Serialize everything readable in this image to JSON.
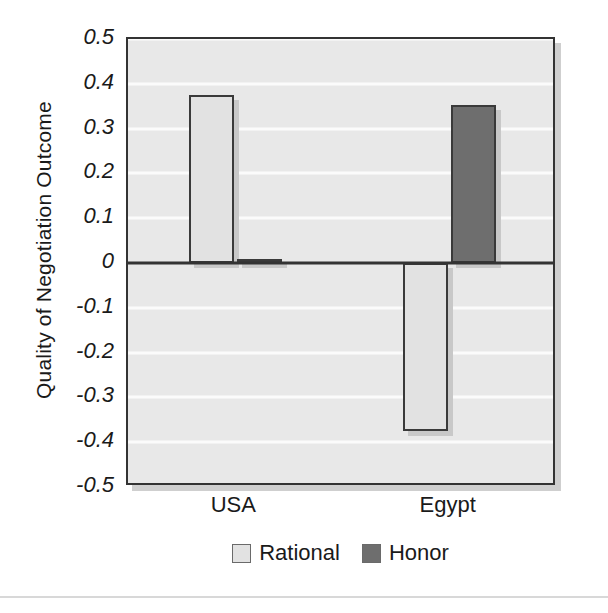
{
  "chart_data": {
    "type": "bar",
    "title": "",
    "subtitle": "",
    "xlabel": "",
    "ylabel": "Quality of Negotiation Outcome",
    "categories": [
      "USA",
      "Egypt"
    ],
    "series": [
      {
        "name": "Rational",
        "color": "#e2e2e2",
        "values": [
          0.375,
          -0.375
        ]
      },
      {
        "name": "Honor",
        "color": "#6e6e6e",
        "values": [
          0.008,
          0.353
        ]
      }
    ],
    "ylim": [
      -0.5,
      0.5
    ],
    "ytick_labels": [
      "0.5",
      "0.4",
      "0.3",
      "0.2",
      "0.1",
      "0",
      "-0.1",
      "-0.2",
      "-0.3",
      "-0.4",
      "-0.5"
    ],
    "ytick_values": [
      0.5,
      0.4,
      0.3,
      0.2,
      0.1,
      0,
      -0.1,
      -0.2,
      -0.3,
      -0.4,
      -0.5
    ],
    "grid": true,
    "grid_color": "#fbfbfb",
    "zero_line": true,
    "legend_position": "bottom",
    "plot_background": "#e8e8e8",
    "axis_color": "#333333",
    "bar_border_color": "#3a3a3a"
  },
  "axis": {
    "y_title": "Quality of Negotiation Outcome"
  },
  "legend": {
    "entries": [
      {
        "label": "Rational",
        "color": "#e2e2e2"
      },
      {
        "label": "Honor",
        "color": "#6e6e6e"
      }
    ]
  }
}
